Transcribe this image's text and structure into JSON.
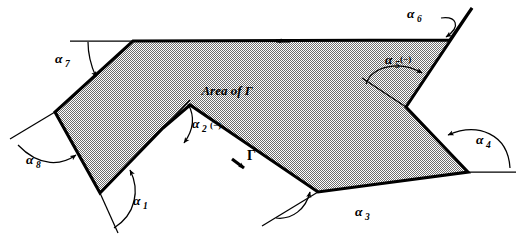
{
  "figure": {
    "title_text": "Area of  Γ",
    "curve_label": "Γ",
    "region_fill_description": "dithered-gray-50",
    "colors": {
      "ink": "#000000",
      "background": "#ffffff",
      "region_fill": "#9a9a9a"
    },
    "area_label": {
      "prefix": "Area of",
      "symbol": "Γ"
    },
    "angles": [
      {
        "id": "a1",
        "base": "α",
        "subscript": "1",
        "sign": "",
        "x": 140,
        "y": 205
      },
      {
        "id": "a2",
        "base": "α",
        "subscript": "2",
        "sign": "(−)",
        "x": 199,
        "y": 128
      },
      {
        "id": "a3",
        "base": "α",
        "subscript": "3",
        "sign": "",
        "x": 362,
        "y": 216
      },
      {
        "id": "a4",
        "base": "α",
        "subscript": "4",
        "sign": "",
        "x": 483,
        "y": 144
      },
      {
        "id": "a5",
        "base": "α",
        "subscript": "5",
        "sign": "(−)",
        "x": 395,
        "y": 64
      },
      {
        "id": "a6",
        "base": "α",
        "subscript": "6",
        "sign": "",
        "x": 414,
        "y": 16
      },
      {
        "id": "a7",
        "base": "α",
        "subscript": "7",
        "sign": "",
        "x": 62,
        "y": 60
      },
      {
        "id": "a8",
        "base": "α",
        "subscript": "8",
        "sign": "",
        "x": 33,
        "y": 164
      }
    ],
    "vertices": [
      {
        "name": "v-top-left-notch",
        "x": 133,
        "y": 41
      },
      {
        "name": "v-top-right-inner",
        "x": 450,
        "y": 40
      },
      {
        "name": "v-top-right-apex",
        "x": 472,
        "y": 8
      },
      {
        "name": "v-right-notch-apex",
        "x": 406,
        "y": 107
      },
      {
        "name": "v-right-far",
        "x": 468,
        "y": 172
      },
      {
        "name": "v-bottom-mid",
        "x": 318,
        "y": 192
      },
      {
        "name": "v-spike-top",
        "x": 190,
        "y": 105
      },
      {
        "name": "v-notch-apex",
        "x": 163,
        "y": 128
      },
      {
        "name": "v-bottom-left",
        "x": 100,
        "y": 193
      },
      {
        "name": "v-left",
        "x": 55,
        "y": 112
      }
    ],
    "direction_arrows": [
      {
        "name": "top-edge-arrow",
        "x": 278,
        "y": 41,
        "direction": "left"
      },
      {
        "name": "gamma-edge-arrow",
        "x": 243,
        "y": 168,
        "direction": "down-right"
      }
    ]
  }
}
